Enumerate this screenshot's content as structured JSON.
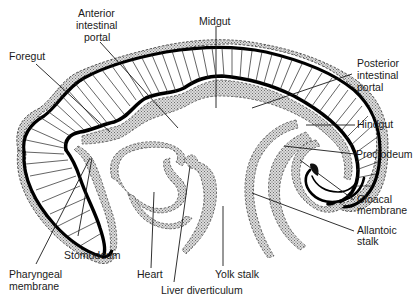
{
  "figure": {
    "labels": {
      "anterior_intestinal_portal": [
        "Anterior",
        "intestinal",
        "portal"
      ],
      "midgut": "Midgut",
      "foregut": "Foregut",
      "posterior_intestinal_portal": [
        "Posterior",
        "intestinal",
        "portal"
      ],
      "hindgut": "Hindgut",
      "proctodeum": "Proctodeum",
      "cloacal_membrane": [
        "Cloacal",
        "membrane"
      ],
      "allantoic_stalk": [
        "Allantoic",
        "stalk"
      ],
      "stomodeum": "Stomodeum",
      "pharyngeal_membrane": [
        "Pharyngeal",
        "membrane"
      ],
      "heart": "Heart",
      "yolk_stalk": "Yolk stalk",
      "liver_diverticulum": "Liver diverticulum"
    },
    "colors": {
      "ink": "#1a1a1a",
      "background": "#ffffff",
      "stipple": "#9a9a9a"
    }
  }
}
